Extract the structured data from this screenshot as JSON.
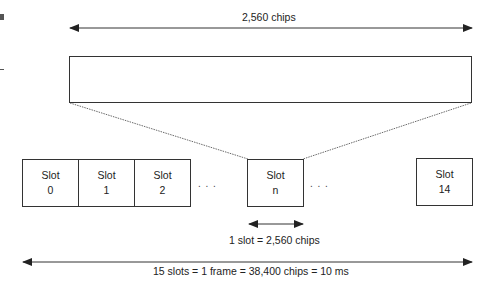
{
  "top_span": {
    "label": "2,560 chips"
  },
  "slots": [
    {
      "title": "Slot",
      "index": "0"
    },
    {
      "title": "Slot",
      "index": "1"
    },
    {
      "title": "Slot",
      "index": "2"
    },
    {
      "title": "Slot",
      "index": "n"
    },
    {
      "title": "Slot",
      "index": "14"
    }
  ],
  "ellipsis": ". . .",
  "slot_span": {
    "label": "1 slot = 2,560 chips"
  },
  "frame_span": {
    "label": "15 slots = 1 frame = 38,400 chips = 10 ms"
  }
}
